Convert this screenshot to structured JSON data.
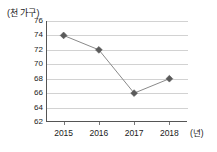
{
  "chart_data": {
    "type": "line",
    "title": "",
    "subtitle": "",
    "categories": [
      "2015",
      "2016",
      "2017",
      "2018"
    ],
    "x": [
      2015,
      2016,
      2017,
      2018
    ],
    "values": [
      74,
      72,
      66,
      68
    ],
    "series": [
      {
        "name": "",
        "values": [
          74,
          72,
          66,
          68
        ]
      }
    ],
    "xlabel": "(년)",
    "ylabel": "(천 가구)",
    "ylim": [
      62,
      76
    ],
    "ytick_labels": [
      "76",
      "74",
      "72",
      "70",
      "68",
      "66",
      "64",
      "62"
    ],
    "ytick_values": [
      76,
      74,
      72,
      70,
      68,
      66,
      64,
      62
    ],
    "xtick_labels": [
      "2015",
      "2016",
      "2017",
      "2018"
    ],
    "grid": "horizontal",
    "legend": "none",
    "marker": "diamond",
    "annotations": [],
    "colors": {
      "line": "#8a8a8a",
      "marker": "#5a5a5a",
      "gridline": "#d2d2d2",
      "axis": "#555555",
      "text": "#1a1a1a",
      "background": "#ffffff"
    }
  },
  "axes": {
    "y_unit_caption": "(천 가구)",
    "x_unit_caption": "(년)"
  }
}
